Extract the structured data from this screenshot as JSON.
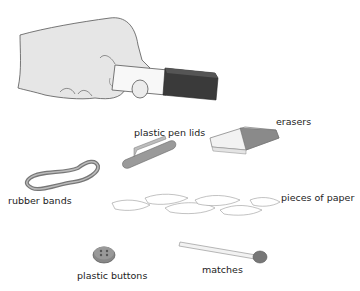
{
  "labels": {
    "pen_lids": "plastic pen lids",
    "erasers": "erasers",
    "rubber_bands": "rubber bands",
    "paper": "pieces of paper",
    "buttons": "plastic buttons",
    "matches": "matches"
  }
}
